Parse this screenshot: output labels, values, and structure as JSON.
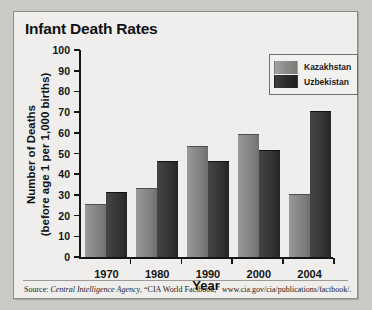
{
  "chart_data": {
    "type": "bar",
    "title": "Infant Death Rates",
    "xlabel": "Year",
    "ylabel_line1": "Number of Deaths",
    "ylabel_line2": "(before age 1 per 1,000 births)",
    "categories": [
      "1970",
      "1980",
      "1990",
      "2000",
      "2004"
    ],
    "series": [
      {
        "name": "Kazakhstan",
        "color": "#8a8a88",
        "values": [
          25,
          33,
          53,
          59,
          30
        ]
      },
      {
        "name": "Uzbekistan",
        "color": "#2d2d2b",
        "values": [
          31,
          46,
          46,
          51,
          70
        ]
      }
    ],
    "ylim": [
      0,
      100
    ],
    "yticks": [
      0,
      10,
      20,
      30,
      40,
      50,
      60,
      70,
      80,
      90,
      100
    ],
    "ytick_labels": [
      "0",
      "10",
      "20",
      "30",
      "40",
      "50",
      "60",
      "70",
      "80",
      "90",
      "100"
    ],
    "grid": false,
    "legend_position": "top-right"
  },
  "source": {
    "prefix": "Source:",
    "agency": "Central Intelligence Agency",
    "rest": ", “CIA World Factbook,” www.cia.gov/cia/publications/factbook/."
  }
}
